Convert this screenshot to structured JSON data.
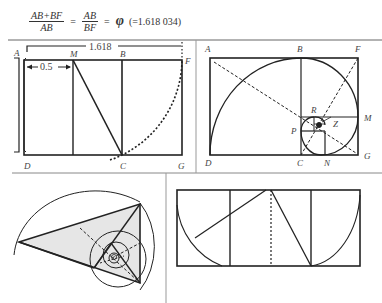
{
  "formula": {
    "frac1_num": "AB+BF",
    "frac1_den": "AB",
    "eq1": "=",
    "frac2_num": "AB",
    "frac2_den": "BF",
    "eq2": "=",
    "phi": "φ",
    "value": "(=1.618 034)"
  },
  "panel_top_left": {
    "dimension_total": "1.618",
    "dimension_half": "0.5",
    "labels": {
      "A": "A",
      "M": "M",
      "B": "B",
      "F": "F",
      "D": "D",
      "C": "C",
      "G": "G"
    }
  },
  "panel_top_right": {
    "labels": {
      "A": "A",
      "B": "B",
      "F": "F",
      "M": "M",
      "D": "D",
      "C": "C",
      "N": "N",
      "G": "G",
      "R": "R",
      "P": "P",
      "Z": "Z"
    }
  },
  "panel_bottom_left": {
    "description": "golden triangle with inscribed spiral of circles"
  },
  "panel_bottom_right": {
    "description": "golden rectangle construction with arcs"
  },
  "colors": {
    "line": "#222222",
    "fill_shade": "#e6e6e6",
    "divider": "#888888"
  }
}
